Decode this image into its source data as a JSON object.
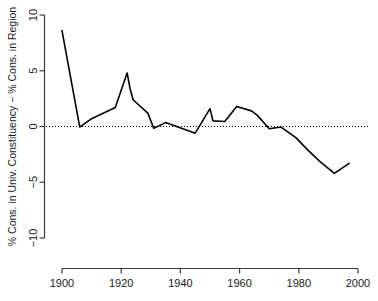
{
  "chart_data": {
    "type": "line",
    "title": "",
    "subtitle": "",
    "xlabel": "",
    "ylabel": "% Cons. in Univ. Constituency − % Cons. in Region",
    "xlim": [
      1900,
      2000
    ],
    "ylim": [
      -10,
      10
    ],
    "xticks": [
      1900,
      1920,
      1940,
      1960,
      1980,
      2000
    ],
    "xtick_labels": [
      "1900",
      "1920",
      "1940",
      "1960",
      "1980",
      "2000"
    ],
    "yticks": [
      -10,
      -5,
      0,
      5,
      10
    ],
    "ytick_labels": [
      "−10",
      "−5",
      "0",
      "5",
      "10"
    ],
    "grid": false,
    "legend": null,
    "legend_position": "none",
    "annotations": [
      {
        "kind": "reference-line",
        "axis": "y",
        "value": 0,
        "style": "dotted",
        "color": "#000000"
      }
    ],
    "line_color": "#000000",
    "line_width": 1.6,
    "series": [
      {
        "name": "% Cons. in Univ. Constituency − % Cons. in Region",
        "x": [
          1900,
          1906,
          1910,
          1918,
          1922,
          1923,
          1924,
          1929,
          1931,
          1935,
          1945,
          1950,
          1951,
          1955,
          1959,
          1964,
          1966,
          1970,
          1974,
          1979,
          1983,
          1987,
          1992,
          1997
        ],
        "values": [
          8.6,
          -0.05,
          0.7,
          1.7,
          4.8,
          3.4,
          2.4,
          1.2,
          -0.15,
          0.35,
          -0.6,
          1.6,
          0.5,
          0.45,
          1.8,
          1.4,
          1.0,
          -0.2,
          -0.05,
          -1.0,
          -2.1,
          -3.1,
          -4.2,
          -3.3
        ]
      }
    ]
  },
  "axes": {
    "y_axis_name": "y-axis",
    "x_axis_name": "x-axis"
  }
}
